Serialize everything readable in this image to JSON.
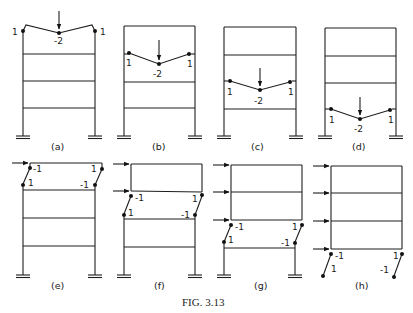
{
  "figure": {
    "caption": "Fig. 3.13",
    "caption_display": "FIG. 3.13",
    "colors": {
      "ink": "#1e1e1e",
      "background": "#ffffff"
    }
  },
  "panels": [
    {
      "id": "a",
      "label": "(a)",
      "type": "beam",
      "storey": 4,
      "hinge_values": [
        "1",
        "-2",
        "1"
      ]
    },
    {
      "id": "b",
      "label": "(b)",
      "type": "beam",
      "storey": 3,
      "hinge_values": [
        "1",
        "-2",
        "1"
      ]
    },
    {
      "id": "c",
      "label": "(c)",
      "type": "beam",
      "storey": 2,
      "hinge_values": [
        "1",
        "-2",
        "1"
      ]
    },
    {
      "id": "d",
      "label": "(d)",
      "type": "beam",
      "storey": 1,
      "hinge_values": [
        "1",
        "-2",
        "1"
      ]
    },
    {
      "id": "e",
      "label": "(e)",
      "type": "sway",
      "storey": 4,
      "hinge_values": [
        "-1",
        "1",
        "1",
        "-1"
      ]
    },
    {
      "id": "f",
      "label": "(f)",
      "type": "sway",
      "storey": 3,
      "hinge_values": [
        "-1",
        "1",
        "1",
        "-1"
      ]
    },
    {
      "id": "g",
      "label": "(g)",
      "type": "sway",
      "storey": 2,
      "hinge_values": [
        "-1",
        "1",
        "1",
        "-1"
      ]
    },
    {
      "id": "h",
      "label": "(h)",
      "type": "sway",
      "storey": 1,
      "hinge_values": [
        "-1",
        "1",
        "1",
        "-1"
      ]
    }
  ],
  "labels": {
    "a": "(a)",
    "b": "(b)",
    "c": "(c)",
    "d": "(d)",
    "e": "(e)",
    "f": "(f)",
    "g": "(g)",
    "h": "(h)",
    "one": "1",
    "neg_one": "-1",
    "neg_two": "-2"
  }
}
